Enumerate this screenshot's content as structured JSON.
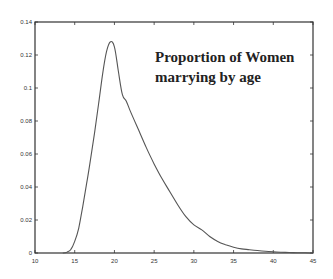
{
  "chart_data": {
    "type": "line",
    "title": "Proportion of Women marrying by age",
    "title_lines": [
      "Proportion of Women",
      "marrying by age"
    ],
    "xlabel": "",
    "ylabel": "",
    "xlim": [
      10,
      45
    ],
    "ylim": [
      0,
      0.14
    ],
    "x_ticks": [
      10,
      15,
      20,
      25,
      30,
      35,
      40,
      45
    ],
    "x_tick_labels": [
      "10",
      "15",
      "20",
      "25",
      "30",
      "35",
      "40",
      "45"
    ],
    "y_ticks": [
      0,
      0.02,
      0.04,
      0.06,
      0.08,
      0.1,
      0.12,
      0.14
    ],
    "y_tick_labels": [
      "0",
      "0.02",
      "0.04",
      "0.06",
      "0.08",
      "0.1",
      "0.12",
      "0.14"
    ],
    "grid": false,
    "legend": null,
    "series": [
      {
        "name": "Proportion of Women marrying",
        "color": "#555555",
        "x": [
          13.5,
          14,
          14.5,
          15,
          15.5,
          16,
          16.5,
          17,
          17.5,
          18,
          18.5,
          19,
          19.5,
          20,
          20.5,
          21,
          21.5,
          22,
          23,
          24,
          25,
          26,
          27,
          28,
          29,
          30,
          31,
          32,
          33,
          34,
          35,
          36,
          37,
          38,
          39,
          40,
          41,
          42,
          43,
          44,
          45
        ],
        "y": [
          0.0,
          0.0005,
          0.002,
          0.007,
          0.015,
          0.028,
          0.042,
          0.057,
          0.073,
          0.09,
          0.108,
          0.122,
          0.128,
          0.125,
          0.11,
          0.096,
          0.092,
          0.086,
          0.075,
          0.064,
          0.054,
          0.045,
          0.037,
          0.029,
          0.022,
          0.017,
          0.014,
          0.01,
          0.007,
          0.005,
          0.0035,
          0.0025,
          0.002,
          0.0015,
          0.001,
          0.0007,
          0.0005,
          0.0003,
          0.0002,
          0.0001,
          0.0
        ]
      }
    ]
  }
}
